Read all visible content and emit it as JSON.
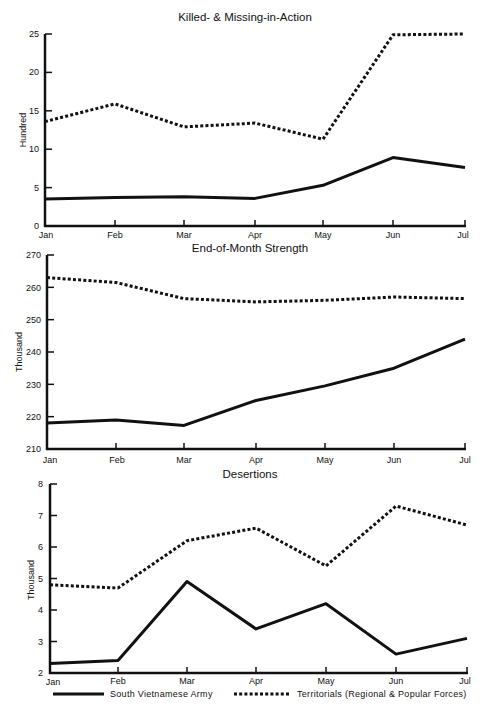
{
  "chart_data": [
    {
      "type": "line",
      "title": "Killed- & Missing-in-Action",
      "xlabel": "",
      "ylabel": "Hundred",
      "categories": [
        "Jan",
        "Feb",
        "Mar",
        "Apr",
        "May",
        "Jun",
        "Jul"
      ],
      "yticks": [
        0,
        5,
        10,
        15,
        20,
        25
      ],
      "ylim": [
        0,
        25
      ],
      "grid": false,
      "series": [
        {
          "name": "South Vietnamese Army",
          "style": "solid",
          "values": [
            3.5,
            3.7,
            3.8,
            3.6,
            5.3,
            8.9,
            7.6
          ]
        },
        {
          "name": "Territorials (Regional & Popular Forces)",
          "style": "dotted",
          "values": [
            13.6,
            15.9,
            12.9,
            13.4,
            11.3,
            24.9,
            25.0
          ]
        }
      ]
    },
    {
      "type": "line",
      "title": "End-of-Month Strength",
      "xlabel": "",
      "ylabel": "Thousand",
      "categories": [
        "Jan",
        "Feb",
        "Mar",
        "Apr",
        "May",
        "Jun",
        "Jul"
      ],
      "yticks": [
        210,
        220,
        230,
        240,
        250,
        260,
        270
      ],
      "ylim": [
        210,
        270
      ],
      "grid": false,
      "series": [
        {
          "name": "South Vietnamese Army",
          "style": "solid",
          "values": [
            218,
            219,
            217.3,
            225,
            229.5,
            235,
            244
          ]
        },
        {
          "name": "Territorials (Regional & Popular Forces)",
          "style": "dotted",
          "values": [
            263,
            261.5,
            256.5,
            255.5,
            256,
            257,
            256.5
          ]
        }
      ]
    },
    {
      "type": "line",
      "title": "Desertions",
      "xlabel": "",
      "ylabel": "Thousand",
      "categories": [
        "Jan",
        "Feb",
        "Mar",
        "Apr",
        "May",
        "Jun",
        "Jul"
      ],
      "yticks": [
        2,
        3,
        4,
        5,
        6,
        7,
        8
      ],
      "ylim": [
        2,
        8
      ],
      "grid": false,
      "series": [
        {
          "name": "South Vietnamese Army",
          "style": "solid",
          "values": [
            2.3,
            2.4,
            4.9,
            3.4,
            4.2,
            2.6,
            3.1
          ]
        },
        {
          "name": "Territorials (Regional & Popular Forces)",
          "style": "dotted",
          "values": [
            4.8,
            4.7,
            6.2,
            6.6,
            5.4,
            7.3,
            6.7
          ]
        }
      ]
    }
  ],
  "legend": {
    "position": "bottom",
    "items": [
      {
        "label": "South Vietnamese Army",
        "style": "solid"
      },
      {
        "label": "Territorials (Regional & Popular Forces)",
        "style": "dotted"
      }
    ]
  },
  "panels": [
    {
      "title": "Killed- & Missing-in-Action",
      "ylabel": "Hundred",
      "yticks": [
        "0",
        "5",
        "10",
        "15",
        "20",
        "25"
      ],
      "xticks": [
        "Jan",
        "Feb",
        "Mar",
        "Apr",
        "May",
        "Jun",
        "Jul"
      ]
    },
    {
      "title": "End-of-Month Strength",
      "ylabel": "Thousand",
      "yticks": [
        "210",
        "220",
        "230",
        "240",
        "250",
        "260",
        "270"
      ],
      "xticks": [
        "Jan",
        "Feb",
        "Mar",
        "Apr",
        "May",
        "Jun",
        "Jul"
      ]
    },
    {
      "title": "Desertions",
      "ylabel": "Thousand",
      "yticks": [
        "2",
        "3",
        "4",
        "5",
        "6",
        "7",
        "8"
      ],
      "xticks": [
        "Jan",
        "Feb",
        "Mar",
        "Apr",
        "May",
        "Jun",
        "Jul"
      ]
    }
  ],
  "colors": {
    "line": "#111111",
    "background": "#ffffff"
  }
}
